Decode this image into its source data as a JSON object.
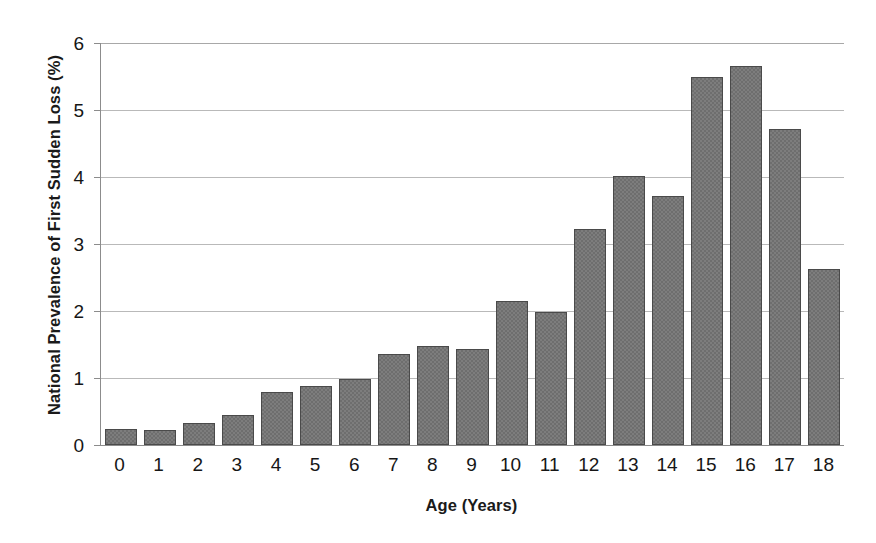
{
  "chart_data": {
    "type": "bar",
    "title": "",
    "xlabel": "Age (Years)",
    "ylabel": "National Prevalence of First Sudden Loss (%)",
    "categories": [
      "0",
      "1",
      "2",
      "3",
      "4",
      "5",
      "6",
      "7",
      "8",
      "9",
      "10",
      "11",
      "12",
      "13",
      "14",
      "15",
      "16",
      "17",
      "18"
    ],
    "values": [
      0.24,
      0.23,
      0.33,
      0.45,
      0.79,
      0.88,
      0.98,
      1.36,
      1.48,
      1.43,
      2.15,
      1.98,
      3.23,
      4.02,
      3.71,
      5.5,
      5.66,
      4.72,
      2.62
    ],
    "ylim": [
      0,
      6
    ],
    "ytick_labels": [
      "0",
      "1",
      "2",
      "3",
      "4",
      "5",
      "6"
    ],
    "ytick_values": [
      0,
      1,
      2,
      3,
      4,
      5,
      6
    ],
    "grid": "horizontal",
    "legend": "none",
    "series_name": "National Prevalence of First Sudden Loss (%)",
    "bar_color": "#6e6e6e",
    "bar_border_color": "#4a4a4a",
    "gridline_color": "#b9b9b9",
    "axis_color": "#8c8c8c",
    "background_color": "#ffffff"
  }
}
